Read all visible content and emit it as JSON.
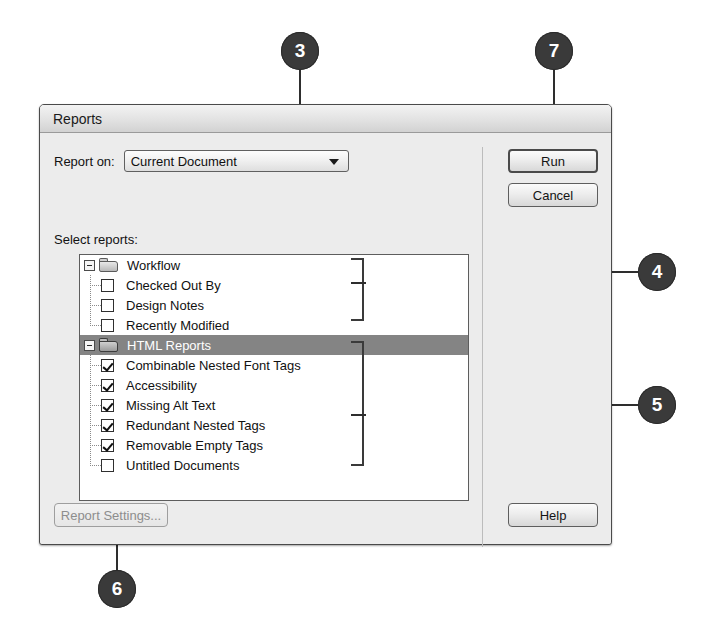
{
  "dialog": {
    "title": "Reports",
    "report_on_label": "Report on:",
    "report_on_value": "Current Document",
    "select_reports_label": "Select reports:",
    "buttons": {
      "run": "Run",
      "cancel": "Cancel",
      "help": "Help",
      "report_settings": "Report Settings..."
    }
  },
  "tree": {
    "groups": [
      {
        "label": "Workflow",
        "selected": false,
        "expanded": true,
        "items": [
          {
            "label": "Checked Out By",
            "checked": false
          },
          {
            "label": "Design Notes",
            "checked": false
          },
          {
            "label": "Recently Modified",
            "checked": false
          }
        ]
      },
      {
        "label": "HTML Reports",
        "selected": true,
        "expanded": true,
        "items": [
          {
            "label": "Combinable Nested Font Tags",
            "checked": true
          },
          {
            "label": "Accessibility",
            "checked": true
          },
          {
            "label": "Missing Alt Text",
            "checked": true
          },
          {
            "label": "Redundant Nested Tags",
            "checked": true
          },
          {
            "label": "Removable Empty Tags",
            "checked": true
          },
          {
            "label": "Untitled Documents",
            "checked": false
          }
        ]
      }
    ]
  },
  "callouts": [
    {
      "number": "3"
    },
    {
      "number": "7"
    },
    {
      "number": "4"
    },
    {
      "number": "5"
    },
    {
      "number": "6"
    }
  ],
  "colors": {
    "callout_fill": "#3a3a3a",
    "callout_text": "#ffffff",
    "selection": "#848484",
    "dialog_face": "#ececec"
  }
}
